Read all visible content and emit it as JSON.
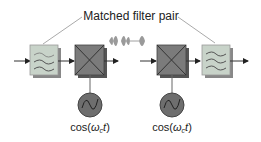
{
  "title": "Matched filter pair",
  "oscillators": [
    {
      "label_prefix": "cos(",
      "omega": "ω",
      "sub": "c",
      "t": "t",
      "suffix": ")"
    },
    {
      "label_prefix": "cos(",
      "omega": "ω",
      "sub": "c",
      "t": "t",
      "suffix": ")"
    }
  ],
  "blocks": [
    "transmit-filter",
    "mixer-1",
    "mixer-2",
    "receive-filter"
  ],
  "colors": {
    "filter_fill": "#c8d3c9",
    "mixer_fill": "#7b7b7b",
    "oscillator_fill": "#6e6e6e",
    "line": "#444444",
    "leader_line": "#aaaaaa",
    "pulse": "#9a9a9a"
  }
}
